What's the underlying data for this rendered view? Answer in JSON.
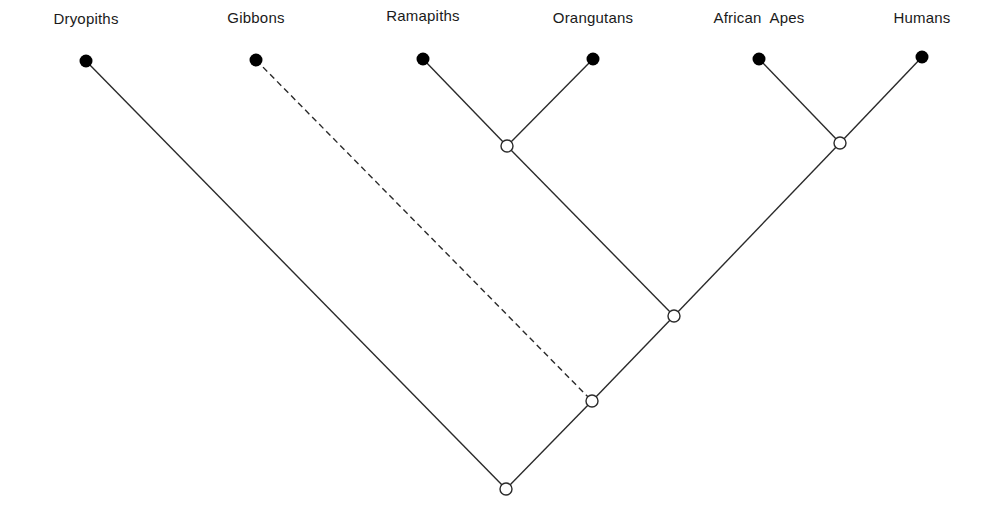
{
  "diagram": {
    "type": "cladogram",
    "line_color": "#2a2a2a",
    "leaf_fill": "#000000",
    "node_fill": "#ffffff",
    "taxa": [
      {
        "id": "dryopiths",
        "label": "Dryopiths",
        "x": 86,
        "y": 61,
        "label_x": 86,
        "label_y": 10
      },
      {
        "id": "gibbons",
        "label": "Gibbons",
        "x": 256,
        "y": 60,
        "label_x": 256,
        "label_y": 9
      },
      {
        "id": "ramapiths",
        "label": "Ramapiths",
        "x": 423,
        "y": 59,
        "label_x": 423,
        "label_y": 7
      },
      {
        "id": "orangutans",
        "label": "Orangutans",
        "x": 593,
        "y": 59,
        "label_x": 593,
        "label_y": 9
      },
      {
        "id": "african-apes",
        "label": "African  Apes",
        "x": 759,
        "y": 59,
        "label_x": 759,
        "label_y": 9
      },
      {
        "id": "humans",
        "label": "Humans",
        "x": 922,
        "y": 57,
        "label_x": 922,
        "label_y": 9
      }
    ],
    "nodes": [
      {
        "id": "n-ramapith-orang",
        "x": 507,
        "y": 146
      },
      {
        "id": "n-afape-human",
        "x": 840,
        "y": 143
      },
      {
        "id": "n-great-apes",
        "x": 674,
        "y": 316
      },
      {
        "id": "n-hominoids",
        "x": 592,
        "y": 401
      },
      {
        "id": "n-root",
        "x": 506,
        "y": 489
      }
    ],
    "edges": [
      {
        "from": "ramapiths",
        "to": "n-ramapith-orang",
        "style": "solid"
      },
      {
        "from": "orangutans",
        "to": "n-ramapith-orang",
        "style": "solid"
      },
      {
        "from": "african-apes",
        "to": "n-afape-human",
        "style": "solid"
      },
      {
        "from": "humans",
        "to": "n-afape-human",
        "style": "solid"
      },
      {
        "from": "n-ramapith-orang",
        "to": "n-great-apes",
        "style": "solid"
      },
      {
        "from": "n-afape-human",
        "to": "n-great-apes",
        "style": "solid"
      },
      {
        "from": "n-great-apes",
        "to": "n-hominoids",
        "style": "solid"
      },
      {
        "from": "gibbons",
        "to": "n-hominoids",
        "style": "dashed"
      },
      {
        "from": "n-hominoids",
        "to": "n-root",
        "style": "solid"
      },
      {
        "from": "dryopiths",
        "to": "n-root",
        "style": "solid"
      }
    ]
  }
}
